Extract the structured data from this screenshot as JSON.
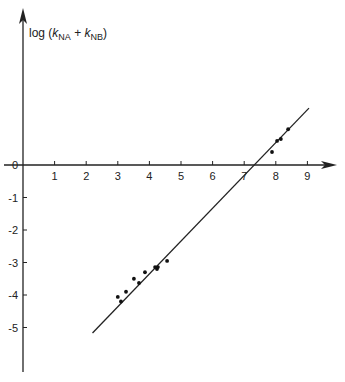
{
  "chart_data": {
    "type": "scatter",
    "title": "",
    "ylabel": "log (k_NA + k_NB)",
    "ylabel_parts": {
      "prefix": "log (",
      "k1": "k",
      "sub1": "NA",
      "plus": " + ",
      "k2": "k",
      "sub2": "NB",
      "suffix": ")"
    },
    "xlabel": "",
    "x_ticks": [
      1,
      2,
      3,
      4,
      5,
      6,
      7,
      8,
      9
    ],
    "y_ticks": [
      0,
      -1,
      -2,
      -3,
      -4,
      -5
    ],
    "x_tick_labels": [
      "1",
      "2",
      "3",
      "4",
      "5",
      "6",
      "7",
      "8",
      "9"
    ],
    "y_tick_labels": [
      "0",
      "-1",
      "-2",
      "-3",
      "-4",
      "-5"
    ],
    "xlim": [
      0,
      9.8
    ],
    "ylim": [
      -6.3,
      5.0
    ],
    "grid": false,
    "legend": null,
    "series": [
      {
        "name": "data",
        "points": [
          [
            3.0,
            -4.06
          ],
          [
            3.1,
            -4.2
          ],
          [
            3.26,
            -3.9
          ],
          [
            3.51,
            -3.5
          ],
          [
            3.67,
            -3.63
          ],
          [
            3.86,
            -3.3
          ],
          [
            4.18,
            -3.14
          ],
          [
            4.24,
            -3.2
          ],
          [
            4.27,
            -3.14
          ],
          [
            4.56,
            -2.95
          ],
          [
            7.88,
            0.4
          ],
          [
            8.04,
            0.74
          ],
          [
            8.16,
            0.8
          ],
          [
            8.39,
            1.1
          ]
        ]
      }
    ],
    "fit_line": {
      "x": [
        2.2,
        9.05
      ],
      "y": [
        -5.17,
        1.75
      ]
    }
  }
}
